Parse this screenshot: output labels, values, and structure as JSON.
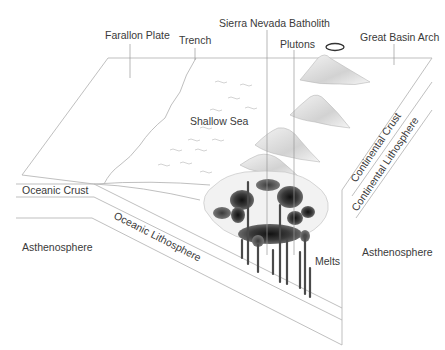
{
  "diagram": {
    "type": "block-diagram",
    "labels": {
      "farallon_plate": "Farallon Plate",
      "trench": "Trench",
      "sierra_nevada_batholith": "Sierra Nevada Batholith",
      "plutons": "Plutons",
      "great_basin_arch": "Great Basin Arch",
      "shallow_sea": "Shallow Sea",
      "oceanic_crust": "Oceanic Crust",
      "oceanic_lithosphere": "Oceanic Lithosphere",
      "asthenosphere_left": "Asthenosphere",
      "asthenosphere_right": "Asthenosphere",
      "melts": "Melts",
      "continental_crust": "Continental Crust",
      "continental_lithosphere": "Continental Lithosphere"
    },
    "colors": {
      "line": "#b8b8b8",
      "text": "#3a3a3a",
      "magma_dark": "#2a2a2a",
      "magma_mid": "#555555",
      "mountain_shade": "#d6d6d6"
    }
  }
}
